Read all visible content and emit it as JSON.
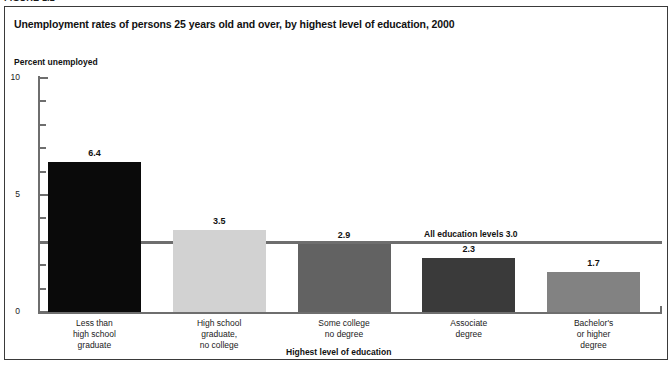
{
  "figure": {
    "label": "FIGURE 1.2"
  },
  "chart_data": {
    "type": "bar",
    "title": "Unemployment rates of persons 25 years old and over, by highest level of education, 2000",
    "xlabel": "Highest level of education",
    "ylabel": "Percent unemployed",
    "ylim": [
      0,
      10
    ],
    "yticks": [
      0,
      1,
      2,
      3,
      4,
      5,
      6,
      7,
      8,
      9,
      10
    ],
    "ytick_labels": [
      "0",
      "",
      "",
      "",
      "",
      "5",
      "",
      "",
      "",
      "",
      "10"
    ],
    "grid": false,
    "legend": "none",
    "categories": [
      "Less than\nhigh school\ngraduate",
      "High school\ngraduate,\nno college",
      "Some college\nno degree",
      "Associate\ndegree",
      "Bachelor's\nor higher\ndegree"
    ],
    "values": [
      6.4,
      3.5,
      2.9,
      2.3,
      1.7
    ],
    "value_labels": [
      "6.4",
      "3.5",
      "2.9",
      "2.3",
      "1.7"
    ],
    "bar_colors": [
      "#0a0a0a",
      "#d2d2d2",
      "#626262",
      "#3a3a3a",
      "#828282"
    ],
    "reference_line": {
      "value": 3.0,
      "label": "All education levels 3.0",
      "color": "#6e6e6e"
    }
  }
}
